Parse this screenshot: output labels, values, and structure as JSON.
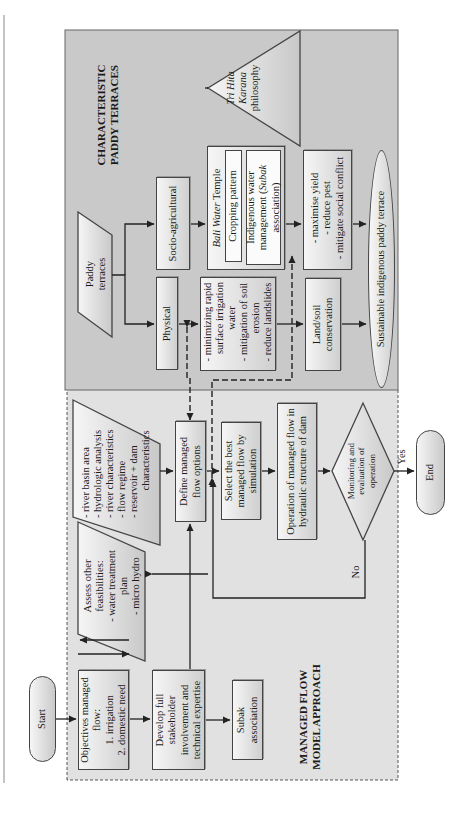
{
  "regions": {
    "paddy_title": [
      "CHARACTERISTIC",
      "PADDY TERRACES"
    ],
    "managed_title": [
      "MANAGED FLOW",
      "MODEL APPROACH"
    ]
  },
  "nodes": {
    "start": "Start",
    "end": "End",
    "objectives": {
      "line1": "Objectives managed",
      "line2": "flow:",
      "line3": "1. irrigation",
      "line4": "2. domestic need"
    },
    "assess": {
      "line1": "Assess other",
      "line2": "feasibilities:",
      "line3": "- water treatment",
      "line4": "plan",
      "line5": "- micro hydro"
    },
    "develop": {
      "line1": "Develop full",
      "line2": "stakeholder",
      "line3": "involvement and",
      "line4": "technical expertise"
    },
    "subak": {
      "line1": "Subak",
      "line2": "association"
    },
    "river": {
      "line1": "- river basin area",
      "line2": "- hydrologic analysis",
      "line3": "- river characteristics",
      "line4": "- flow regime",
      "line5": "- reservoir + dam",
      "line6": "characteristics"
    },
    "define": {
      "line1": "Define managed",
      "line2": "flow options"
    },
    "select": {
      "line1": "Select the best",
      "line2": "managed flow by",
      "line3": "simulation"
    },
    "operation": {
      "line1": "Operation of managed flow in",
      "line2": "hydraulic structure of dam"
    },
    "monitoring": {
      "line1": "Monitoring and",
      "line2": "evaluation of",
      "line3": "operation"
    },
    "paddy": {
      "line1": "Paddy",
      "line2": "terraces"
    },
    "socio": "Socio-agricultural",
    "physical": "Physical",
    "bali": {
      "italic": "Bali Water",
      "rest": " Temple"
    },
    "cropping": "Cropping pattern",
    "indigenous": {
      "line1": "Indigenous water",
      "line2a": "management (",
      "line2b": "Subak",
      "line3": "association)"
    },
    "minimizing": {
      "line1": "- minimizing rapid",
      "line2": "surface irrigation",
      "line3": "water",
      "line4": "- mitigation of soil",
      "line5": "erosion",
      "line6": "- reduce landslides"
    },
    "maximise": {
      "line1": "- maximise yield",
      "line2": "- reduce pest",
      "line3": "- mitigate social conflict"
    },
    "land": {
      "line1": "Land/soil",
      "line2": "conservation"
    },
    "sustainable": "Sustainable indigenous paddy terrace",
    "tri": {
      "line1": "Tri Hita",
      "line2": "Karana",
      "line3": "philosophy"
    }
  },
  "edge_labels": {
    "yes": "Yes",
    "no": "No"
  },
  "colors": {
    "gray_region": "#c8c8c8",
    "dashed_region": "#e0e0e0",
    "stroke": "#333333"
  }
}
